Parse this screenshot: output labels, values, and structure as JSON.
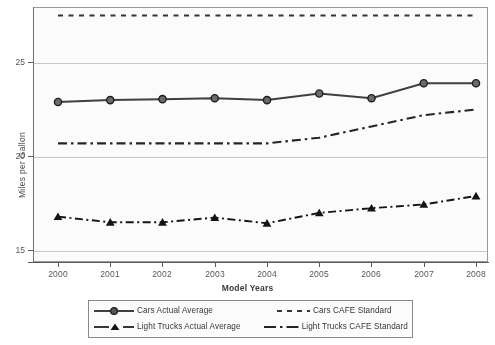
{
  "chart_data": {
    "type": "line",
    "title": "",
    "xlabel": "Model Years",
    "ylabel": "Miles per Gallon",
    "categories": [
      "2000",
      "2001",
      "2002",
      "2003",
      "2004",
      "2005",
      "2006",
      "2007",
      "2008"
    ],
    "x": [
      2000,
      2001,
      2002,
      2003,
      2004,
      2005,
      2006,
      2007,
      2008
    ],
    "ylim": [
      13.6,
      28.6
    ],
    "yticks": [
      15,
      20,
      25
    ],
    "ytick_labels": [
      "15",
      "20",
      "25"
    ],
    "grid": true,
    "legend_position": "bottom",
    "series": [
      {
        "name": "Cars Actual Average",
        "style": "solid-with-circle-markers",
        "color": "#3d3d3d",
        "values": [
          22.9,
          23.0,
          23.05,
          23.1,
          23.0,
          23.35,
          23.1,
          23.9,
          23.9
        ]
      },
      {
        "name": "Light Trucks Actual Average",
        "style": "dash-dot-with-triangle-markers",
        "color": "#111111",
        "values": [
          16.8,
          16.5,
          16.5,
          16.75,
          16.45,
          17.0,
          17.25,
          17.45,
          17.9
        ]
      },
      {
        "name": "Cars CAFE Standard",
        "style": "dashed",
        "color": "#333333",
        "values": [
          27.5,
          27.5,
          27.5,
          27.5,
          27.5,
          27.5,
          27.5,
          27.5,
          27.5
        ]
      },
      {
        "name": "Light Trucks CAFE Standard",
        "style": "long-dash-dot",
        "color": "#222222",
        "values": [
          20.7,
          20.7,
          20.7,
          20.7,
          20.7,
          21.0,
          21.6,
          22.2,
          22.5
        ]
      }
    ]
  },
  "axes": {
    "y_title": "Miles per Gallon",
    "x_title": "Model Years",
    "y_ticks": [
      "25",
      "20",
      "15"
    ],
    "x_ticks": [
      "2000",
      "2001",
      "2002",
      "2003",
      "2004",
      "2005",
      "2006",
      "2007",
      "2008"
    ]
  },
  "legend": {
    "entries": [
      {
        "label": "Cars Actual Average",
        "swatch": "solid-circle-marker-swatch"
      },
      {
        "label": "Cars CAFE Standard",
        "swatch": "dashed-swatch"
      },
      {
        "label": "Light Trucks Actual Average",
        "swatch": "dashdot-triangle-marker-swatch"
      },
      {
        "label": "Light Trucks CAFE Standard",
        "swatch": "longdash-dot-swatch"
      }
    ]
  },
  "colors": {
    "frame": "#9a9a9a",
    "grid": "#c9c9c9",
    "axis": "#5a5a5a",
    "cars_actual": "#3d3d3d",
    "trucks_actual": "#111111",
    "cars_cafe": "#333333",
    "trucks_cafe": "#222222"
  }
}
